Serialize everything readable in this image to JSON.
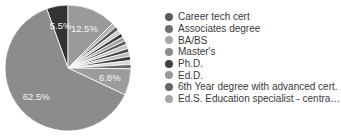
{
  "chart_data": {
    "type": "pie",
    "title": "",
    "start_angle_deg": -19.8,
    "direction": "clockwise",
    "slices": [
      {
        "value": 5.5,
        "label": "5.5%",
        "color": "#333333",
        "show_label": true
      },
      {
        "value": 12.5,
        "label": "12.5%",
        "color": "#9a9a9a",
        "show_label": true
      },
      {
        "value": 1.2,
        "label": "",
        "color": "#b4b4b4",
        "show_label": false
      },
      {
        "value": 1.0,
        "label": "",
        "color": "#555555",
        "show_label": false
      },
      {
        "value": 1.1,
        "label": "",
        "color": "#cfcfcf",
        "show_label": false
      },
      {
        "value": 1.0,
        "label": "",
        "color": "#3e3e3e",
        "show_label": false
      },
      {
        "value": 1.1,
        "label": "",
        "color": "#a2a2a2",
        "show_label": false
      },
      {
        "value": 1.0,
        "label": "",
        "color": "#5c5c5c",
        "show_label": false
      },
      {
        "value": 1.1,
        "label": "",
        "color": "#c4c4c4",
        "show_label": false
      },
      {
        "value": 1.0,
        "label": "",
        "color": "#484848",
        "show_label": false
      },
      {
        "value": 1.0,
        "label": "",
        "color": "#b9b9b9",
        "show_label": false
      },
      {
        "value": 1.1,
        "label": "",
        "color": "#3a3a3a",
        "show_label": false
      },
      {
        "value": 1.0,
        "label": "",
        "color": "#d6d6d6",
        "show_label": false
      },
      {
        "value": 1.1,
        "label": "",
        "color": "#6a6a6a",
        "show_label": false
      },
      {
        "value": 6.8,
        "label": "6.8%",
        "color": "#9c9c9c",
        "show_label": true
      },
      {
        "value": 62.5,
        "label": "62.5%",
        "color": "#8c8c8c",
        "show_label": true
      }
    ],
    "legend": {
      "position": "right",
      "entries": [
        {
          "label": "Career tech cert",
          "color": "#5a5a5a"
        },
        {
          "label": "Associates degree",
          "color": "#6e6e6e"
        },
        {
          "label": "BA/BS",
          "color": "#a8a8a8"
        },
        {
          "label": "Master's",
          "color": "#8c8c8c"
        },
        {
          "label": "Ph.D.",
          "color": "#404040"
        },
        {
          "label": "Ed.D.",
          "color": "#9a9a9a"
        },
        {
          "label": "6th Year degree with advanced cert.",
          "color": "#666666"
        },
        {
          "label": "Ed.S. Education specialist - central o...",
          "color": "#a4a4a4"
        }
      ]
    }
  },
  "pie": {
    "cx": 68,
    "cy": 68,
    "r": 63,
    "label_radius_factor": 0.68,
    "slice_stroke": "#ffffff"
  }
}
